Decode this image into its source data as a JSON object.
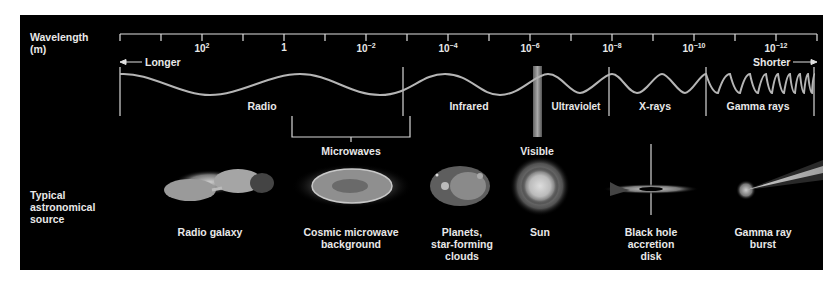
{
  "axis": {
    "title_line1": "Wavelength",
    "title_line2": "(m)",
    "tick_labels": [
      {
        "base": "10",
        "exp": "2"
      },
      {
        "base": "1",
        "exp": ""
      },
      {
        "base": "10",
        "exp": "−2"
      },
      {
        "base": "10",
        "exp": "−4"
      },
      {
        "base": "10",
        "exp": "−6"
      },
      {
        "base": "10",
        "exp": "−8"
      },
      {
        "base": "10",
        "exp": "−10"
      },
      {
        "base": "10",
        "exp": "−12"
      }
    ],
    "longer_label": "Longer",
    "shorter_label": "Shorter"
  },
  "bands": {
    "radio": "Radio",
    "microwaves": "Microwaves",
    "infrared": "Infrared",
    "visible": "Visible",
    "ultraviolet": "Ultraviolet",
    "xrays": "X-rays",
    "gamma": "Gamma rays"
  },
  "sources": {
    "row_label_1": "Typical",
    "row_label_2": "astronomical",
    "row_label_3": "source",
    "items": [
      {
        "line1": "Radio galaxy",
        "line2": "",
        "line3": ""
      },
      {
        "line1": "Cosmic microwave",
        "line2": "background",
        "line3": ""
      },
      {
        "line1": "Planets,",
        "line2": "star-forming",
        "line3": "clouds"
      },
      {
        "line1": "Sun",
        "line2": "",
        "line3": ""
      },
      {
        "line1": "Black hole",
        "line2": "accretion",
        "line3": "disk"
      },
      {
        "line1": "Gamma ray",
        "line2": "burst",
        "line3": ""
      }
    ]
  },
  "colors": {
    "background": "#000000",
    "foreground": "#e8e8e8",
    "wave": "#b0b0b0"
  }
}
